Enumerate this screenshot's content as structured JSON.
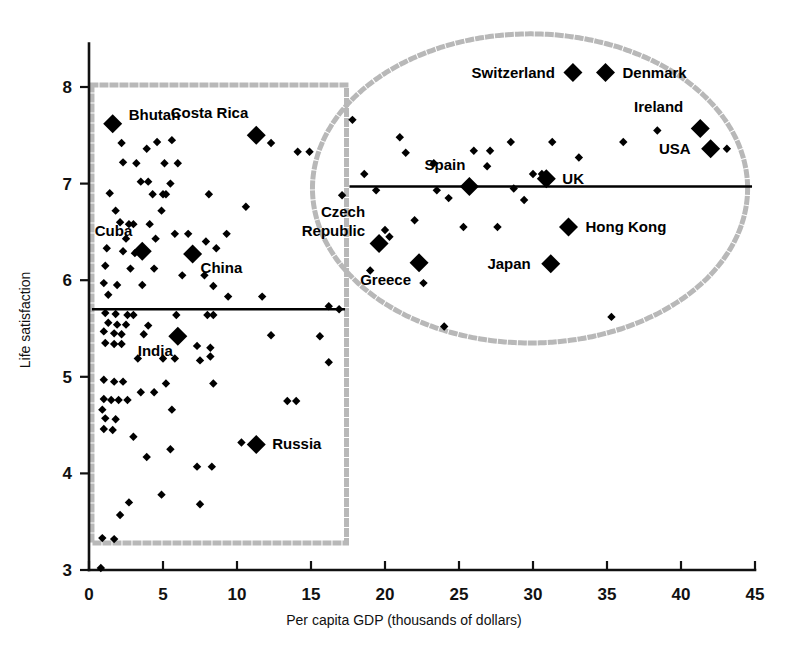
{
  "chart_data": {
    "type": "scatter",
    "title": "",
    "xlabel": "Per capita GDP (thousands of dollars)",
    "ylabel": "Life satisfaction",
    "xlim": [
      0,
      45
    ],
    "ylim": [
      3,
      8.4
    ],
    "xticks": [
      0,
      5,
      10,
      15,
      20,
      25,
      30,
      35,
      40,
      45
    ],
    "xtick_labels": [
      "0",
      "5",
      "10",
      "15",
      "20",
      "25",
      "30",
      "35",
      "40",
      "45"
    ],
    "yticks": [
      3,
      4,
      5,
      6,
      7,
      8
    ],
    "ytick_labels": [
      "3",
      "4",
      "5",
      "6",
      "7",
      "8"
    ],
    "grid": false,
    "legend": "none",
    "marker_color": "#000000",
    "outline_color": "#b8b8b8",
    "reference_line_color": "#000000",
    "labeled_points": [
      {
        "name": "Bhutan",
        "gdp": 1.6,
        "life_satisfaction": 7.62,
        "label_dx": 16,
        "label_dy": -4
      },
      {
        "name": "Costa Rica",
        "gdp": 11.3,
        "life_satisfaction": 7.5,
        "label_dx": -8,
        "label_dy": -17
      },
      {
        "name": "Cuba",
        "gdp": 3.6,
        "life_satisfaction": 6.3,
        "label_dx": -10,
        "label_dy": -15
      },
      {
        "name": "China",
        "gdp": 7.0,
        "life_satisfaction": 6.27,
        "label_dx": 8,
        "label_dy": 19
      },
      {
        "name": "India",
        "gdp": 6.0,
        "life_satisfaction": 5.42,
        "label_dx": -5,
        "label_dy": 20
      },
      {
        "name": "Russia",
        "gdp": 11.3,
        "life_satisfaction": 4.3,
        "label_dx": 16,
        "label_dy": 5
      },
      {
        "name": "Czech Republic",
        "gdp": 19.6,
        "life_satisfaction": 6.38,
        "label_dx": -14,
        "label_dy": -26
      },
      {
        "name": "Greece",
        "gdp": 22.3,
        "life_satisfaction": 6.18,
        "label_dx": -8,
        "label_dy": 22
      },
      {
        "name": "Spain",
        "gdp": 25.7,
        "life_satisfaction": 6.97,
        "label_dx": -4,
        "label_dy": -16
      },
      {
        "name": "UK",
        "gdp": 30.9,
        "life_satisfaction": 7.05,
        "label_dx": 16,
        "label_dy": 5
      },
      {
        "name": "Japan",
        "gdp": 31.2,
        "life_satisfaction": 6.17,
        "label_dx": -20,
        "label_dy": 5
      },
      {
        "name": "Hong Kong",
        "gdp": 32.4,
        "life_satisfaction": 6.55,
        "label_dx": 17,
        "label_dy": 5
      },
      {
        "name": "Switzerland",
        "gdp": 32.7,
        "life_satisfaction": 8.15,
        "label_dx": -18,
        "label_dy": 5
      },
      {
        "name": "Denmark",
        "gdp": 34.9,
        "life_satisfaction": 8.15,
        "label_dx": 17,
        "label_dy": 5
      },
      {
        "name": "Ireland",
        "gdp": 41.3,
        "life_satisfaction": 7.57,
        "label_dx": -17,
        "label_dy": -17
      },
      {
        "name": "USA",
        "gdp": 42.0,
        "life_satisfaction": 7.36,
        "label_dx": -20,
        "label_dy": 5
      }
    ],
    "unlabeled_points": [
      {
        "gdp": 2.2,
        "life_satisfaction": 7.42
      },
      {
        "gdp": 4.6,
        "life_satisfaction": 7.43
      },
      {
        "gdp": 5.6,
        "life_satisfaction": 7.45
      },
      {
        "gdp": 3.9,
        "life_satisfaction": 7.36
      },
      {
        "gdp": 12.3,
        "life_satisfaction": 7.42
      },
      {
        "gdp": 14.1,
        "life_satisfaction": 7.33
      },
      {
        "gdp": 14.9,
        "life_satisfaction": 7.33
      },
      {
        "gdp": 2.3,
        "life_satisfaction": 7.22
      },
      {
        "gdp": 3.2,
        "life_satisfaction": 7.21
      },
      {
        "gdp": 5.1,
        "life_satisfaction": 7.21
      },
      {
        "gdp": 6.0,
        "life_satisfaction": 7.21
      },
      {
        "gdp": 17.8,
        "life_satisfaction": 7.66
      },
      {
        "gdp": 21.4,
        "life_satisfaction": 7.32
      },
      {
        "gdp": 23.3,
        "life_satisfaction": 7.21
      },
      {
        "gdp": 28.5,
        "life_satisfaction": 7.43
      },
      {
        "gdp": 31.3,
        "life_satisfaction": 7.43
      },
      {
        "gdp": 26.0,
        "life_satisfaction": 7.34
      },
      {
        "gdp": 27.1,
        "life_satisfaction": 7.34
      },
      {
        "gdp": 36.1,
        "life_satisfaction": 7.43
      },
      {
        "gdp": 38.4,
        "life_satisfaction": 7.55
      },
      {
        "gdp": 33.1,
        "life_satisfaction": 7.27
      },
      {
        "gdp": 43.1,
        "life_satisfaction": 7.36
      },
      {
        "gdp": 3.5,
        "life_satisfaction": 7.02
      },
      {
        "gdp": 4.0,
        "life_satisfaction": 7.02
      },
      {
        "gdp": 5.5,
        "life_satisfaction": 7.0
      },
      {
        "gdp": 18.6,
        "life_satisfaction": 7.1
      },
      {
        "gdp": 26.9,
        "life_satisfaction": 7.18
      },
      {
        "gdp": 19.4,
        "life_satisfaction": 6.93
      },
      {
        "gdp": 23.5,
        "life_satisfaction": 6.93
      },
      {
        "gdp": 28.7,
        "life_satisfaction": 6.95
      },
      {
        "gdp": 30.0,
        "life_satisfaction": 7.1
      },
      {
        "gdp": 30.6,
        "life_satisfaction": 7.1
      },
      {
        "gdp": 1.4,
        "life_satisfaction": 6.9
      },
      {
        "gdp": 4.3,
        "life_satisfaction": 6.89
      },
      {
        "gdp": 5.0,
        "life_satisfaction": 6.89
      },
      {
        "gdp": 5.2,
        "life_satisfaction": 6.89
      },
      {
        "gdp": 8.1,
        "life_satisfaction": 6.89
      },
      {
        "gdp": 17.1,
        "life_satisfaction": 6.88
      },
      {
        "gdp": 1.8,
        "life_satisfaction": 6.72
      },
      {
        "gdp": 4.9,
        "life_satisfaction": 6.72
      },
      {
        "gdp": 10.6,
        "life_satisfaction": 6.76
      },
      {
        "gdp": 2.1,
        "life_satisfaction": 6.6
      },
      {
        "gdp": 2.7,
        "life_satisfaction": 6.58
      },
      {
        "gdp": 3.0,
        "life_satisfaction": 6.58
      },
      {
        "gdp": 4.1,
        "life_satisfaction": 6.58
      },
      {
        "gdp": 24.3,
        "life_satisfaction": 6.85
      },
      {
        "gdp": 29.4,
        "life_satisfaction": 6.83
      },
      {
        "gdp": 5.8,
        "life_satisfaction": 6.48
      },
      {
        "gdp": 6.7,
        "life_satisfaction": 6.48
      },
      {
        "gdp": 9.3,
        "life_satisfaction": 6.48
      },
      {
        "gdp": 2.5,
        "life_satisfaction": 6.43
      },
      {
        "gdp": 4.5,
        "life_satisfaction": 6.43
      },
      {
        "gdp": 22.0,
        "life_satisfaction": 6.62
      },
      {
        "gdp": 25.3,
        "life_satisfaction": 6.55
      },
      {
        "gdp": 27.6,
        "life_satisfaction": 6.55
      },
      {
        "gdp": 1.2,
        "life_satisfaction": 6.33
      },
      {
        "gdp": 2.3,
        "life_satisfaction": 6.3
      },
      {
        "gdp": 3.1,
        "life_satisfaction": 6.28
      },
      {
        "gdp": 7.9,
        "life_satisfaction": 6.4
      },
      {
        "gdp": 8.6,
        "life_satisfaction": 6.33
      },
      {
        "gdp": 20.3,
        "life_satisfaction": 6.45
      },
      {
        "gdp": 1.1,
        "life_satisfaction": 6.15
      },
      {
        "gdp": 2.8,
        "life_satisfaction": 6.12
      },
      {
        "gdp": 4.4,
        "life_satisfaction": 6.12
      },
      {
        "gdp": 6.3,
        "life_satisfaction": 6.05
      },
      {
        "gdp": 7.8,
        "life_satisfaction": 6.05
      },
      {
        "gdp": 19.0,
        "life_satisfaction": 6.1
      },
      {
        "gdp": 22.6,
        "life_satisfaction": 5.97
      },
      {
        "gdp": 1.0,
        "life_satisfaction": 5.97
      },
      {
        "gdp": 1.9,
        "life_satisfaction": 5.95
      },
      {
        "gdp": 3.6,
        "life_satisfaction": 5.95
      },
      {
        "gdp": 8.4,
        "life_satisfaction": 5.94
      },
      {
        "gdp": 1.3,
        "life_satisfaction": 5.85
      },
      {
        "gdp": 9.4,
        "life_satisfaction": 5.83
      },
      {
        "gdp": 11.7,
        "life_satisfaction": 5.83
      },
      {
        "gdp": 16.2,
        "life_satisfaction": 5.73
      },
      {
        "gdp": 16.9,
        "life_satisfaction": 5.7
      },
      {
        "gdp": 1.1,
        "life_satisfaction": 5.66
      },
      {
        "gdp": 1.8,
        "life_satisfaction": 5.65
      },
      {
        "gdp": 2.6,
        "life_satisfaction": 5.64
      },
      {
        "gdp": 3.0,
        "life_satisfaction": 5.64
      },
      {
        "gdp": 5.9,
        "life_satisfaction": 5.64
      },
      {
        "gdp": 8.0,
        "life_satisfaction": 5.64
      },
      {
        "gdp": 8.4,
        "life_satisfaction": 5.64
      },
      {
        "gdp": 1.3,
        "life_satisfaction": 5.56
      },
      {
        "gdp": 1.9,
        "life_satisfaction": 5.54
      },
      {
        "gdp": 2.5,
        "life_satisfaction": 5.54
      },
      {
        "gdp": 4.0,
        "life_satisfaction": 5.53
      },
      {
        "gdp": 1.0,
        "life_satisfaction": 5.47
      },
      {
        "gdp": 1.7,
        "life_satisfaction": 5.45
      },
      {
        "gdp": 2.2,
        "life_satisfaction": 5.44
      },
      {
        "gdp": 3.7,
        "life_satisfaction": 5.44
      },
      {
        "gdp": 12.3,
        "life_satisfaction": 5.43
      },
      {
        "gdp": 15.6,
        "life_satisfaction": 5.42
      },
      {
        "gdp": 1.1,
        "life_satisfaction": 5.35
      },
      {
        "gdp": 1.7,
        "life_satisfaction": 5.34
      },
      {
        "gdp": 2.2,
        "life_satisfaction": 5.34
      },
      {
        "gdp": 7.3,
        "life_satisfaction": 5.32
      },
      {
        "gdp": 8.2,
        "life_satisfaction": 5.3
      },
      {
        "gdp": 8.2,
        "life_satisfaction": 5.21
      },
      {
        "gdp": 3.3,
        "life_satisfaction": 5.19
      },
      {
        "gdp": 5.0,
        "life_satisfaction": 5.19
      },
      {
        "gdp": 5.8,
        "life_satisfaction": 5.19
      },
      {
        "gdp": 7.5,
        "life_satisfaction": 5.17
      },
      {
        "gdp": 16.2,
        "life_satisfaction": 5.15
      },
      {
        "gdp": 1.0,
        "life_satisfaction": 4.97
      },
      {
        "gdp": 1.7,
        "life_satisfaction": 4.95
      },
      {
        "gdp": 2.3,
        "life_satisfaction": 4.95
      },
      {
        "gdp": 5.2,
        "life_satisfaction": 4.93
      },
      {
        "gdp": 8.4,
        "life_satisfaction": 4.93
      },
      {
        "gdp": 3.5,
        "life_satisfaction": 4.84
      },
      {
        "gdp": 4.4,
        "life_satisfaction": 4.84
      },
      {
        "gdp": 1.0,
        "life_satisfaction": 4.77
      },
      {
        "gdp": 1.5,
        "life_satisfaction": 4.76
      },
      {
        "gdp": 2.0,
        "life_satisfaction": 4.76
      },
      {
        "gdp": 2.6,
        "life_satisfaction": 4.76
      },
      {
        "gdp": 13.4,
        "life_satisfaction": 4.75
      },
      {
        "gdp": 14.0,
        "life_satisfaction": 4.75
      },
      {
        "gdp": 0.9,
        "life_satisfaction": 4.66
      },
      {
        "gdp": 5.6,
        "life_satisfaction": 4.66
      },
      {
        "gdp": 1.1,
        "life_satisfaction": 4.57
      },
      {
        "gdp": 1.8,
        "life_satisfaction": 4.56
      },
      {
        "gdp": 1.0,
        "life_satisfaction": 4.46
      },
      {
        "gdp": 1.6,
        "life_satisfaction": 4.45
      },
      {
        "gdp": 3.0,
        "life_satisfaction": 4.38
      },
      {
        "gdp": 10.3,
        "life_satisfaction": 4.32
      },
      {
        "gdp": 5.5,
        "life_satisfaction": 4.25
      },
      {
        "gdp": 3.9,
        "life_satisfaction": 4.17
      },
      {
        "gdp": 7.3,
        "life_satisfaction": 4.07
      },
      {
        "gdp": 8.3,
        "life_satisfaction": 4.07
      },
      {
        "gdp": 4.9,
        "life_satisfaction": 3.78
      },
      {
        "gdp": 2.7,
        "life_satisfaction": 3.7
      },
      {
        "gdp": 7.5,
        "life_satisfaction": 3.68
      },
      {
        "gdp": 2.1,
        "life_satisfaction": 3.57
      },
      {
        "gdp": 0.9,
        "life_satisfaction": 3.33
      },
      {
        "gdp": 1.7,
        "life_satisfaction": 3.32
      },
      {
        "gdp": 0.8,
        "life_satisfaction": 3.02
      },
      {
        "gdp": 20.0,
        "life_satisfaction": 6.52
      },
      {
        "gdp": 21.0,
        "life_satisfaction": 7.48
      },
      {
        "gdp": 35.3,
        "life_satisfaction": 5.62
      },
      {
        "gdp": 24.0,
        "life_satisfaction": 5.52
      }
    ],
    "reference_lines": [
      {
        "name": "developing-average",
        "y": 5.7,
        "x_start": 0.2,
        "x_end": 17.3
      },
      {
        "name": "developed-average",
        "y": 6.97,
        "x_start": 17.6,
        "x_end": 44.8
      }
    ],
    "group_outlines": [
      {
        "name": "developing-countries-box",
        "shape": "rect",
        "x0": 0.2,
        "x1": 17.4,
        "y0": 3.28,
        "y1": 8.02
      },
      {
        "name": "developed-countries-ellipse",
        "shape": "ellipse",
        "cx": 29.8,
        "cy": 6.95,
        "rx": 14.7,
        "ry": 1.6
      }
    ]
  }
}
